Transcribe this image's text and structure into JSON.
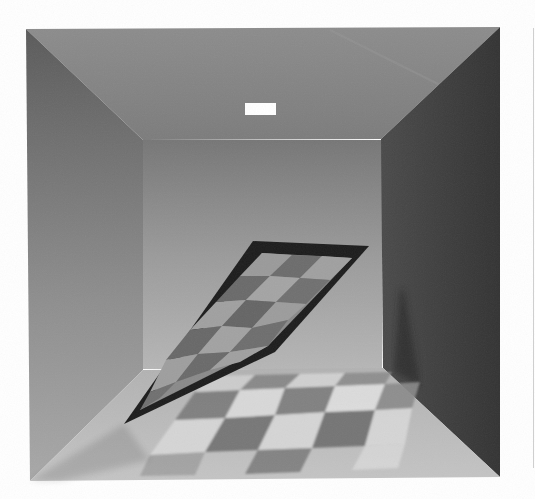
{
  "image": {
    "subject": "Rendered room with tilted checkerboard panel",
    "width": 535,
    "height": 499
  },
  "scene": {
    "background": "#ffffff",
    "outer_box": {
      "tl": [
        26,
        29
      ],
      "tr": [
        500,
        27
      ],
      "br": [
        500,
        477
      ],
      "bl": [
        30,
        481
      ]
    },
    "back_wall": {
      "tl": [
        143,
        140
      ],
      "tr": [
        381,
        139
      ],
      "br": [
        383,
        368
      ],
      "bl": [
        143,
        370
      ]
    },
    "colors": {
      "ceiling_top": "#8a8a8a",
      "ceiling_bottom": "#7e7e7e",
      "left_wall_top": "#5e5e5e",
      "left_wall_bottom": "#a9a9a9",
      "back_wall_top": "#7a7a7a",
      "back_wall_bottom": "#b4b4b4",
      "right_wall": "#3e3e3e",
      "floor": "#bdbdbd",
      "light": "#ffffff",
      "panel_frame": "#1e1e1e",
      "checker_dark": "#6c6c6c",
      "checker_light": "#d6d6d6"
    },
    "light": {
      "x": 245,
      "y": 103,
      "w": 31,
      "h": 12
    },
    "panel": {
      "outer": [
        [
          253,
          241
        ],
        [
          369,
          246
        ],
        [
          275,
          352
        ],
        [
          124,
          424
        ]
      ],
      "inner": [
        [
          262,
          253
        ],
        [
          352,
          258
        ],
        [
          268,
          346
        ],
        [
          140,
          410
        ]
      ],
      "grid": [
        6,
        6
      ]
    },
    "floor_checker": {
      "corners": [
        [
          150,
          460
        ],
        [
          195,
          385
        ],
        [
          420,
          375
        ],
        [
          395,
          470
        ]
      ],
      "grid": [
        6,
        5
      ]
    },
    "page_edge": {
      "x": 533
    }
  }
}
